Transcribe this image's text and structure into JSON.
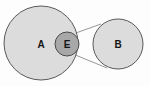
{
  "diagram": {
    "type": "venn-callout",
    "background_color": "#fdfdfd",
    "canvas": {
      "width": 150,
      "height": 86
    },
    "shapes": [
      {
        "id": "circle-a",
        "label": "A",
        "role": "primary-set",
        "shape": "circle",
        "cx": 41,
        "cy": 43,
        "r": 37,
        "fill": "#dcdcdc",
        "stroke": "#5a5a5a",
        "stroke_width": 1,
        "label_x": 41,
        "label_y": 44
      },
      {
        "id": "circle-e",
        "label": "E",
        "role": "intersection-detail",
        "shape": "circle",
        "cx": 67,
        "cy": 44,
        "r": 12,
        "fill": "#a8a8a8",
        "stroke": "#4a4a4a",
        "stroke_width": 1,
        "label_x": 67,
        "label_y": 44
      },
      {
        "id": "circle-b",
        "label": "B",
        "role": "magnified-set",
        "shape": "circle",
        "cx": 118,
        "cy": 44,
        "r": 25,
        "fill": "#dcdcdc",
        "stroke": "#5a5a5a",
        "stroke_width": 1,
        "label_x": 118,
        "label_y": 44
      }
    ],
    "connectors": [
      {
        "id": "callout-line-top",
        "from": "circle-e",
        "to": "circle-b",
        "x1": 73,
        "y1": 34,
        "x2": 101,
        "y2": 24,
        "stroke": "#6b6b6b",
        "stroke_width": 0.7
      },
      {
        "id": "callout-line-bottom",
        "from": "circle-e",
        "to": "circle-b",
        "x1": 73,
        "y1": 54,
        "x2": 107,
        "y2": 68,
        "stroke": "#6b6b6b",
        "stroke_width": 0.7
      }
    ],
    "labels": {
      "a": "A",
      "e": "E",
      "b": "B"
    },
    "colors": {
      "set_fill": "#dcdcdc",
      "detail_fill": "#a8a8a8",
      "outline": "#5a5a5a",
      "connector": "#6b6b6b",
      "text": "#151515",
      "background": "#fdfdfd"
    }
  }
}
